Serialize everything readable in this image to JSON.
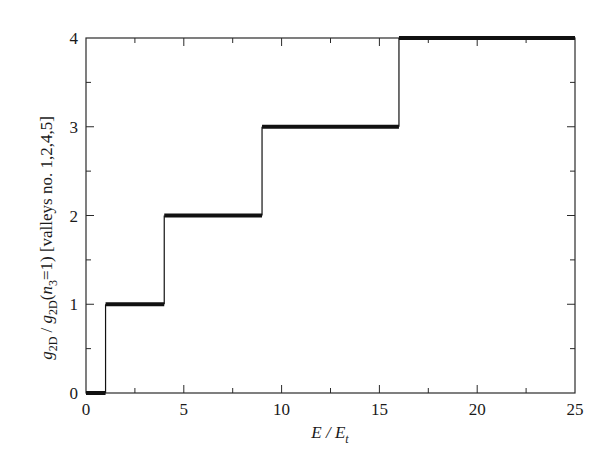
{
  "chart_data": {
    "type": "line",
    "subtype": "step",
    "title": "",
    "xlabel": "E / E_t",
    "ylabel": "g_2D / g_2D(n_3=1) [valleys no. 1,2,4,5]",
    "xlim": [
      0,
      25
    ],
    "ylim": [
      0,
      4
    ],
    "x_major_ticks": [
      0,
      5,
      10,
      15,
      20,
      25
    ],
    "x_minor_step": 2.5,
    "y_major_ticks": [
      0,
      1,
      2,
      3,
      4
    ],
    "y_minor_step": 0.5,
    "grid": false,
    "legend": null,
    "series": [
      {
        "name": "g_2D / g_2D(n_3=1)",
        "steps": [
          {
            "x_start": 0,
            "x_end": 1,
            "y": 0
          },
          {
            "x_start": 1,
            "x_end": 4,
            "y": 1
          },
          {
            "x_start": 4,
            "x_end": 9,
            "y": 2
          },
          {
            "x_start": 9,
            "x_end": 16,
            "y": 3
          },
          {
            "x_start": 16,
            "x_end": 25,
            "y": 4
          }
        ],
        "x": [
          0,
          1,
          1,
          4,
          4,
          9,
          9,
          16,
          16,
          25
        ],
        "y": [
          0,
          0,
          1,
          1,
          2,
          2,
          3,
          3,
          4,
          4
        ]
      }
    ]
  },
  "labels": {
    "x_main": "E / E",
    "x_sub": "t",
    "y_g1": "g",
    "y_sub1": "2D",
    "y_slash": " / ",
    "y_g2": "g",
    "y_sub2": "2D",
    "y_paren_open": "(",
    "y_n": "n",
    "y_sub3": "3",
    "y_rest": "=1) [valleys no. 1,2,4,5]"
  },
  "colors": {
    "axis": "#2a2a2a",
    "line": "#111111",
    "background": "#ffffff"
  }
}
